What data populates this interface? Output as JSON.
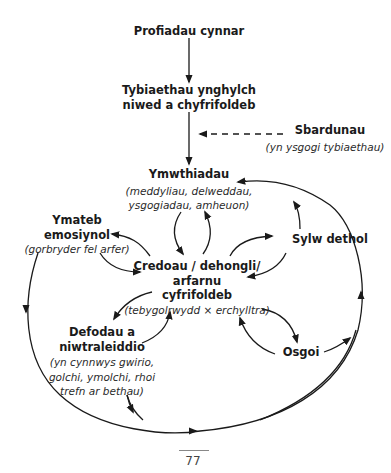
{
  "diagram": {
    "nodes": {
      "early_experiences": {
        "title": "Profiadau cynnar"
      },
      "assumptions": {
        "line1": "Tybiaethau ynghylch",
        "line2": "niwed a chyfrifoldeb"
      },
      "triggers": {
        "title": "Sbardunau",
        "subtitle": "(yn ysgogi tybiaethau)"
      },
      "intrusions": {
        "title": "Ymwthiadau",
        "sub1": "(meddyliau, delweddau,",
        "sub2": "ysgogiadau, amheuon)"
      },
      "emotional_response": {
        "line1": "Ymateb",
        "line2": "emosiynol",
        "subtitle": "(gorbryder fel arfer)"
      },
      "selective_attention": {
        "title": "Sylw dethol"
      },
      "beliefs": {
        "line1": "Credoau / dehongli/",
        "line2": "arfarnu",
        "line3": "cyfrifoldeb",
        "subtitle": "(tebygolrwydd × erchylltra)"
      },
      "rituals": {
        "line1": "Defodau a",
        "line2": "niwtraleiddio",
        "sub1": "(yn cynnwys gwirio,",
        "sub2": "golchi, ymolchi, rhoi",
        "sub3": "trefn ar bethau)"
      },
      "avoidance": {
        "title": "Osgoi"
      }
    },
    "edges": [
      {
        "from": "Profiadau cynnar",
        "to": "Tybiaethau ynghylch niwed a chyfrifoldeb",
        "style": "solid"
      },
      {
        "from": "Tybiaethau ynghylch niwed a chyfrifoldeb",
        "to": "Ymwthiadau",
        "style": "solid"
      },
      {
        "from": "Sbardunau",
        "to": "Tybiaethau-Ymwthiadau link",
        "style": "dashed"
      },
      {
        "from": "Ymwthiadau",
        "to": "Credoau",
        "style": "solid"
      },
      {
        "from": "Credoau",
        "to": "Ymwthiadau",
        "style": "solid"
      },
      {
        "from": "Credoau",
        "to": "Ymateb emosiynol",
        "style": "solid"
      },
      {
        "from": "Ymateb emosiynol",
        "to": "Credoau",
        "style": "solid"
      },
      {
        "from": "Credoau",
        "to": "Sylw dethol",
        "style": "solid"
      },
      {
        "from": "Sylw dethol",
        "to": "Credoau",
        "style": "solid"
      },
      {
        "from": "Sylw dethol",
        "to": "Ymwthiadau",
        "style": "solid"
      },
      {
        "from": "Credoau",
        "to": "Defodau a niwtraleiddio",
        "style": "solid"
      },
      {
        "from": "Defodau a niwtraleiddio",
        "to": "Credoau",
        "style": "solid"
      },
      {
        "from": "Credoau",
        "to": "Osgoi",
        "style": "solid"
      },
      {
        "from": "Osgoi",
        "to": "Credoau",
        "style": "solid"
      },
      {
        "from": "Ymateb emosiynol",
        "to": "outer loop",
        "style": "solid"
      },
      {
        "from": "Defodau a niwtraleiddio",
        "to": "outer loop",
        "style": "solid"
      },
      {
        "from": "Osgoi",
        "to": "outer loop",
        "style": "solid"
      },
      {
        "from": "outer loop",
        "to": "Ymwthiadau",
        "style": "solid"
      }
    ]
  },
  "footer": {
    "page_number": "77"
  },
  "colors": {
    "ink": "#1a1a1a",
    "background": "#ffffff"
  }
}
